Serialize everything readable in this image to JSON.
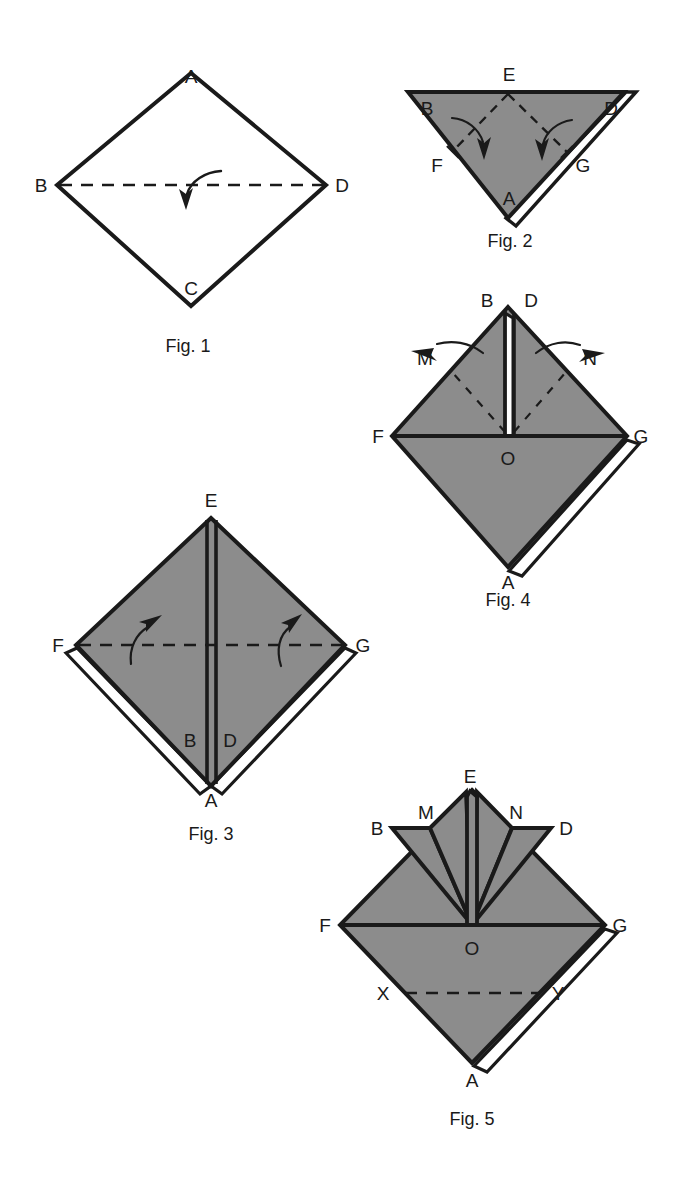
{
  "document": {
    "title": "Origami Folding Sequence",
    "background_color": "#ffffff",
    "paper_gray": "#8c8c8c",
    "paper_white": "#ffffff",
    "line_color": "#1a1a1a"
  },
  "figures": [
    {
      "id": "fig1",
      "caption": "Fig. 1",
      "caption_pos": {
        "x": 188,
        "y": 346
      },
      "shape": "diamond",
      "fill": "#ffffff",
      "vertices": [
        {
          "name": "A",
          "label": "A",
          "x": 191,
          "y": 73,
          "label_x": 191,
          "label_y": 76
        },
        {
          "name": "B",
          "label": "B",
          "x": 57,
          "y": 185,
          "label_x": 41,
          "label_y": 185
        },
        {
          "name": "C",
          "label": "C",
          "x": 191,
          "y": 306,
          "label_x": 191,
          "label_y": 288
        },
        {
          "name": "D",
          "label": "D",
          "x": 326,
          "y": 185,
          "label_x": 342,
          "label_y": 185
        }
      ],
      "fold_lines": [
        {
          "kind": "dashed",
          "from": "B",
          "to": "D"
        }
      ],
      "arrows": [
        {
          "kind": "curved-down",
          "label": "",
          "tip_x": 186,
          "tip_y": 205
        }
      ]
    },
    {
      "id": "fig2",
      "caption": "Fig. 2",
      "caption_pos": {
        "x": 510,
        "y": 241
      },
      "shape": "inverted-triangle",
      "fill": "#8c8c8c",
      "vertices": [
        {
          "name": "B",
          "label": "B",
          "x": 408,
          "y": 92,
          "label_x": 427,
          "label_y": 108
        },
        {
          "name": "E",
          "label": "E",
          "x": 508,
          "y": 92,
          "label_x": 509,
          "label_y": 74
        },
        {
          "name": "D",
          "label": "D",
          "x": 624,
          "y": 92,
          "label_x": 611,
          "label_y": 108
        },
        {
          "name": "F",
          "label": "F",
          "x": 452,
          "y": 152,
          "label_x": 437,
          "label_y": 165
        },
        {
          "name": "G",
          "label": "G",
          "x": 567,
          "y": 152,
          "label_x": 583,
          "label_y": 165
        },
        {
          "name": "A",
          "label": "A",
          "x": 508,
          "y": 218,
          "label_x": 509,
          "label_y": 198
        }
      ],
      "fold_lines": [
        {
          "kind": "dashed",
          "from": "E",
          "to": "F"
        },
        {
          "kind": "dashed",
          "from": "E",
          "to": "G"
        }
      ],
      "arrows": [
        {
          "kind": "curved-down",
          "label": "",
          "tip_x": 483,
          "tip_y": 155
        },
        {
          "kind": "curved-down",
          "label": "",
          "tip_x": 543,
          "tip_y": 155
        }
      ]
    },
    {
      "id": "fig3",
      "caption": "Fig. 3",
      "caption_pos": {
        "x": 211,
        "y": 834
      },
      "shape": "diamond",
      "fill": "#8c8c8c",
      "vertices": [
        {
          "name": "E",
          "label": "E",
          "x": 211,
          "y": 518,
          "label_x": 211,
          "label_y": 500
        },
        {
          "name": "F",
          "label": "F",
          "x": 76,
          "y": 645,
          "label_x": 58,
          "label_y": 645
        },
        {
          "name": "G",
          "label": "G",
          "x": 345,
          "y": 645,
          "label_x": 363,
          "label_y": 645
        },
        {
          "name": "A",
          "label": "A",
          "x": 211,
          "y": 786,
          "label_x": 211,
          "label_y": 800
        },
        {
          "name": "B",
          "label": "B",
          "x": 197,
          "y": 740,
          "label_x": 190,
          "label_y": 740
        },
        {
          "name": "D",
          "label": "D",
          "x": 225,
          "y": 740,
          "label_x": 230,
          "label_y": 740
        }
      ],
      "fold_lines": [
        {
          "kind": "dashed",
          "from": "F",
          "to": "G"
        }
      ],
      "arrows": [
        {
          "kind": "curved-up",
          "label": "",
          "tip_x": 146,
          "tip_y": 621
        },
        {
          "kind": "curved-up",
          "label": "",
          "tip_x": 271,
          "tip_y": 621
        }
      ]
    },
    {
      "id": "fig4",
      "caption": "Fig. 4",
      "caption_pos": {
        "x": 508,
        "y": 600
      },
      "shape": "diamond",
      "fill": "#8c8c8c",
      "vertices": [
        {
          "name": "B",
          "label": "B",
          "x": 502,
          "y": 307,
          "label_x": 487,
          "label_y": 300
        },
        {
          "name": "D",
          "label": "D",
          "x": 513,
          "y": 307,
          "label_x": 531,
          "label_y": 300
        },
        {
          "name": "F",
          "label": "F",
          "x": 392,
          "y": 436,
          "label_x": 378,
          "label_y": 436
        },
        {
          "name": "G",
          "label": "G",
          "x": 627,
          "y": 436,
          "label_x": 641,
          "label_y": 436
        },
        {
          "name": "O",
          "label": "O",
          "x": 508,
          "y": 436,
          "label_x": 508,
          "label_y": 458
        },
        {
          "name": "A",
          "label": "A",
          "x": 508,
          "y": 567,
          "label_x": 508,
          "label_y": 582
        },
        {
          "name": "M",
          "label": "M",
          "x": 440,
          "y": 358,
          "label_x": 425,
          "label_y": 358
        },
        {
          "name": "N",
          "label": "N",
          "x": 576,
          "y": 358,
          "label_x": 590,
          "label_y": 358
        }
      ],
      "fold_lines": [
        {
          "kind": "dashed",
          "from": "O",
          "to": "M"
        },
        {
          "kind": "dashed",
          "from": "O",
          "to": "N"
        }
      ],
      "arrows": [
        {
          "kind": "curved-left",
          "label": "M",
          "tip_x": 412,
          "tip_y": 350
        },
        {
          "kind": "curved-right",
          "label": "N",
          "tip_x": 582,
          "tip_y": 352
        }
      ]
    },
    {
      "id": "fig5",
      "caption": "Fig. 5",
      "caption_pos": {
        "x": 472,
        "y": 1119
      },
      "shape": "diamond-with-fan",
      "fill": "#8c8c8c",
      "vertices": [
        {
          "name": "E",
          "label": "E",
          "x": 470,
          "y": 791,
          "label_x": 470,
          "label_y": 776
        },
        {
          "name": "B",
          "label": "B",
          "x": 392,
          "y": 828,
          "label_x": 377,
          "label_y": 828
        },
        {
          "name": "M",
          "label": "M",
          "x": 430,
          "y": 828,
          "label_x": 426,
          "label_y": 812
        },
        {
          "name": "N",
          "label": "N",
          "x": 512,
          "y": 828,
          "label_x": 516,
          "label_y": 812
        },
        {
          "name": "D",
          "label": "D",
          "x": 551,
          "y": 828,
          "label_x": 566,
          "label_y": 828
        },
        {
          "name": "F",
          "label": "F",
          "x": 340,
          "y": 925,
          "label_x": 325,
          "label_y": 925
        },
        {
          "name": "G",
          "label": "G",
          "x": 605,
          "y": 925,
          "label_x": 620,
          "label_y": 925
        },
        {
          "name": "O",
          "label": "O",
          "x": 472,
          "y": 925,
          "label_x": 472,
          "label_y": 948
        },
        {
          "name": "X",
          "label": "X",
          "x": 405,
          "y": 993,
          "label_x": 383,
          "label_y": 993
        },
        {
          "name": "Y",
          "label": "Y",
          "x": 540,
          "y": 993,
          "label_x": 558,
          "label_y": 993
        },
        {
          "name": "A",
          "label": "A",
          "x": 472,
          "y": 1063,
          "label_x": 472,
          "label_y": 1080
        }
      ],
      "fold_lines": [
        {
          "kind": "dashed",
          "from": "X",
          "to": "Y"
        }
      ],
      "arrows": []
    }
  ]
}
